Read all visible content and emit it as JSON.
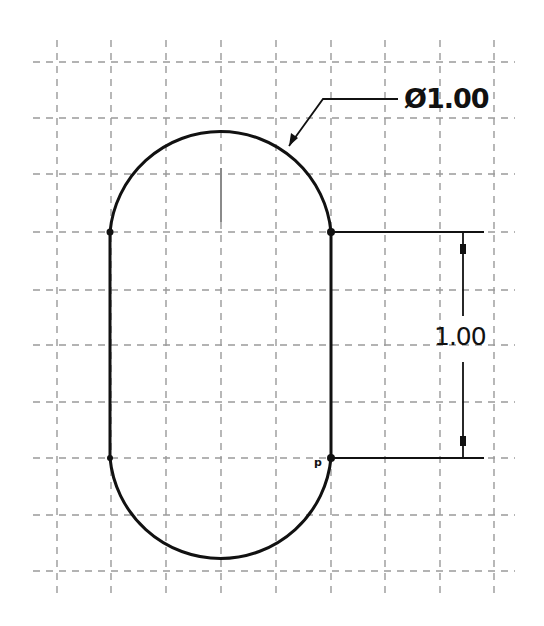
{
  "drawing": {
    "type": "slot sketch",
    "grid": {
      "x": [
        57,
        111,
        166,
        221,
        276,
        331,
        385,
        440,
        494
      ],
      "y": [
        62,
        118,
        174,
        232,
        290,
        345,
        402,
        458,
        515,
        571
      ],
      "color": "#9a9a9a"
    },
    "slot": {
      "left_x": 110,
      "right_x": 331,
      "top_center_y": 232,
      "bottom_center_y": 458,
      "radius": 111,
      "line_color": "#111111"
    },
    "dimensions": {
      "diameter": {
        "label": "Ø1.00",
        "value": "1.00",
        "symbol": "Ø"
      },
      "length": {
        "label": "1.00",
        "value": "1.00"
      }
    }
  }
}
